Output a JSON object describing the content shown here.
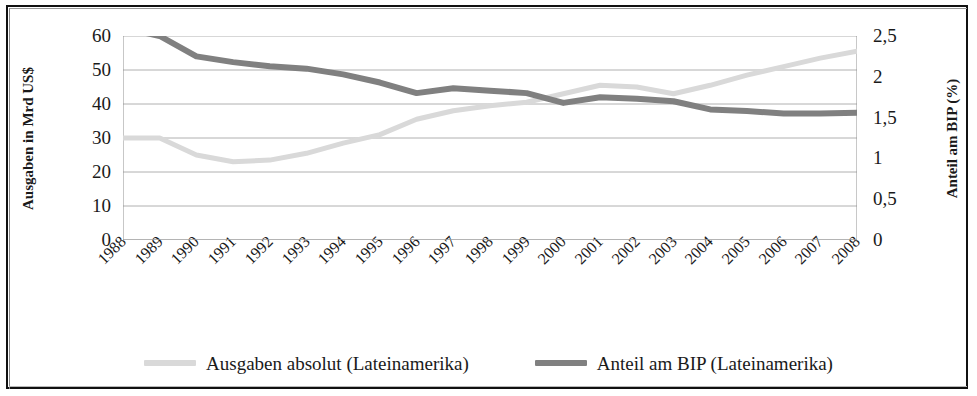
{
  "chart_data": {
    "type": "line",
    "title": "",
    "xlabel": "",
    "ylabel": "Ausgaben in Mrd US$",
    "ylabel_secondary": "Anteil am BIP (%)",
    "grid": true,
    "legend_position": "bottom",
    "ylim": [
      0,
      60
    ],
    "ylim_secondary": [
      0,
      2.5
    ],
    "yticks": [
      "0",
      "10",
      "20",
      "30",
      "40",
      "50",
      "60"
    ],
    "yticks_secondary": [
      "0",
      "0,5",
      "1",
      "1,5",
      "2",
      "2,5"
    ],
    "categories": [
      "1988",
      "1989",
      "1990",
      "1991",
      "1992",
      "1993",
      "1994",
      "1995",
      "1996",
      "1997",
      "1998",
      "1999",
      "2000",
      "2001",
      "2002",
      "2003",
      "2004",
      "2005",
      "2006",
      "2007",
      "2008"
    ],
    "series": [
      {
        "name": "Ausgaben absolut (Lateinamerika)",
        "axis": "left",
        "color": "#d9d9d9",
        "values": [
          30.0,
          30.0,
          25.0,
          23.0,
          23.5,
          25.5,
          28.5,
          31.0,
          35.5,
          38.0,
          39.5,
          40.5,
          43.0,
          45.5,
          45.0,
          43.0,
          45.5,
          48.5,
          51.0,
          53.5,
          55.5
        ]
      },
      {
        "name": "Anteil am BIP (Lateinamerika)",
        "axis": "right",
        "color": "#808080",
        "values": [
          2.6,
          2.5,
          2.25,
          2.18,
          2.13,
          2.1,
          2.03,
          1.93,
          1.8,
          1.86,
          1.83,
          1.8,
          1.68,
          1.75,
          1.73,
          1.7,
          1.6,
          1.58,
          1.55,
          1.55,
          1.56
        ]
      }
    ]
  },
  "legend": {
    "items": [
      {
        "label": "Ausgaben absolut (Lateinamerika)",
        "color": "#d9d9d9"
      },
      {
        "label": "Anteil am BIP (Lateinamerika)",
        "color": "#808080"
      }
    ]
  }
}
